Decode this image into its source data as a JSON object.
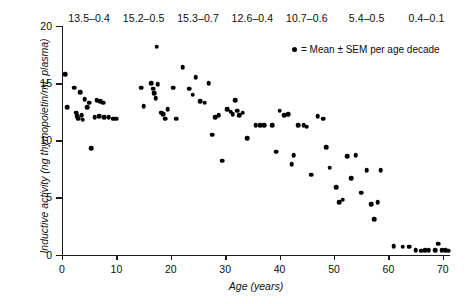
{
  "chart_data": {
    "type": "scatter",
    "title": "",
    "xlabel": "Age (years)",
    "ylabel": "Inductive activity (ng thymopoietin/mL plasma)",
    "xlim": [
      0,
      71.5
    ],
    "ylim": [
      0,
      20
    ],
    "xticks": [
      0,
      10,
      20,
      30,
      40,
      50,
      60,
      70
    ],
    "yticks": [
      0,
      5,
      10,
      15,
      20
    ],
    "grid": false,
    "legend_position": "top-right",
    "legend": [
      {
        "marker": "filled-circle",
        "color": "#000000",
        "label": "= Mean ± SEM per age decade"
      }
    ],
    "annotations": [
      {
        "text": "13.5–0.4",
        "age_center": 5,
        "decade": "0–10"
      },
      {
        "text": "15.2–0.5",
        "age_center": 15,
        "decade": "10–20"
      },
      {
        "text": "15.3–0.7",
        "age_center": 25,
        "decade": "20–30"
      },
      {
        "text": "12.6–0.4",
        "age_center": 35,
        "decade": "30–40"
      },
      {
        "text": "10.7–0.6",
        "age_center": 45,
        "decade": "40–50"
      },
      {
        "text": "5.4–0.5",
        "age_center": 56,
        "decade": "50–60"
      },
      {
        "text": "0.4–0.1",
        "age_center": 67,
        "decade": "60–70"
      }
    ],
    "decade_means": [
      {
        "decade": "0–10",
        "mean": 13.5,
        "sem": 0.4
      },
      {
        "decade": "10–20",
        "mean": 15.2,
        "sem": 0.5
      },
      {
        "decade": "20–30",
        "mean": 15.3,
        "sem": 0.7
      },
      {
        "decade": "30–40",
        "mean": 12.6,
        "sem": 0.4
      },
      {
        "decade": "40–50",
        "mean": 10.7,
        "sem": 0.6
      },
      {
        "decade": "50–60",
        "mean": 5.4,
        "sem": 0.5
      },
      {
        "decade": "60–70",
        "mean": 0.4,
        "sem": 0.1
      }
    ],
    "points": [
      [
        0.6,
        15.8
      ],
      [
        1.0,
        12.9
      ],
      [
        2.2,
        14.6
      ],
      [
        2.6,
        12.4
      ],
      [
        2.8,
        12.1
      ],
      [
        3.0,
        11.9
      ],
      [
        3.4,
        14.2
      ],
      [
        3.6,
        12.2
      ],
      [
        3.8,
        11.8
      ],
      [
        4.2,
        13.6
      ],
      [
        4.6,
        12.9
      ],
      [
        5.0,
        13.3
      ],
      [
        5.4,
        9.3
      ],
      [
        6.0,
        12.0
      ],
      [
        6.4,
        13.5
      ],
      [
        6.8,
        12.1
      ],
      [
        7.0,
        13.4
      ],
      [
        7.6,
        13.3
      ],
      [
        7.8,
        12.0
      ],
      [
        8.6,
        12.0
      ],
      [
        9.4,
        11.9
      ],
      [
        10.0,
        11.9
      ],
      [
        14.6,
        14.6
      ],
      [
        15.0,
        13.0
      ],
      [
        16.4,
        15.0
      ],
      [
        16.8,
        14.5
      ],
      [
        17.0,
        14.1
      ],
      [
        17.2,
        13.7
      ],
      [
        17.4,
        18.2
      ],
      [
        17.6,
        14.9
      ],
      [
        18.2,
        12.4
      ],
      [
        18.6,
        12.3
      ],
      [
        19.0,
        11.9
      ],
      [
        19.4,
        12.7
      ],
      [
        20.4,
        14.6
      ],
      [
        21.0,
        11.9
      ],
      [
        22.2,
        16.4
      ],
      [
        23.4,
        14.5
      ],
      [
        24.0,
        14.0
      ],
      [
        24.6,
        15.5
      ],
      [
        25.4,
        13.4
      ],
      [
        26.2,
        13.3
      ],
      [
        27.0,
        15.0
      ],
      [
        27.6,
        10.5
      ],
      [
        28.2,
        12.0
      ],
      [
        28.8,
        12.2
      ],
      [
        29.4,
        8.2
      ],
      [
        30.4,
        12.7
      ],
      [
        31.0,
        12.5
      ],
      [
        31.4,
        12.3
      ],
      [
        31.8,
        13.5
      ],
      [
        32.2,
        12.6
      ],
      [
        32.6,
        12.2
      ],
      [
        33.2,
        12.4
      ],
      [
        34.0,
        10.2
      ],
      [
        35.6,
        11.3
      ],
      [
        36.4,
        11.3
      ],
      [
        37.2,
        11.3
      ],
      [
        38.6,
        11.3
      ],
      [
        39.4,
        9.0
      ],
      [
        40.0,
        12.6
      ],
      [
        40.8,
        12.2
      ],
      [
        41.6,
        12.3
      ],
      [
        42.2,
        7.9
      ],
      [
        42.6,
        8.7
      ],
      [
        43.4,
        11.3
      ],
      [
        44.4,
        11.3
      ],
      [
        45.0,
        11.2
      ],
      [
        45.8,
        7.0
      ],
      [
        47.0,
        12.1
      ],
      [
        48.0,
        11.9
      ],
      [
        48.6,
        9.4
      ],
      [
        49.2,
        7.6
      ],
      [
        50.4,
        5.9
      ],
      [
        51.0,
        4.6
      ],
      [
        51.6,
        4.8
      ],
      [
        52.4,
        8.6
      ],
      [
        53.2,
        6.7
      ],
      [
        54.0,
        8.7
      ],
      [
        55.0,
        5.4
      ],
      [
        56.0,
        7.4
      ],
      [
        56.8,
        4.4
      ],
      [
        57.4,
        3.1
      ],
      [
        58.0,
        4.6
      ],
      [
        58.6,
        7.4
      ],
      [
        61.0,
        0.75
      ],
      [
        62.6,
        0.7
      ],
      [
        63.8,
        0.7
      ],
      [
        65.0,
        0.4
      ],
      [
        66.0,
        0.35
      ],
      [
        66.8,
        0.4
      ],
      [
        67.4,
        0.4
      ],
      [
        68.6,
        0.4
      ],
      [
        69.2,
        0.95
      ],
      [
        69.8,
        0.4
      ],
      [
        70.4,
        0.4
      ],
      [
        71.0,
        0.35
      ]
    ]
  }
}
